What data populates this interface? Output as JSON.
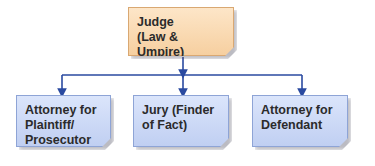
{
  "diagram": {
    "type": "hierarchy",
    "root": {
      "label_line1": "Judge",
      "label_line2": "(Law & Umpire)"
    },
    "children": [
      {
        "line1": "Attorney for",
        "line2": "Plaintiff/",
        "line3": "Prosecutor"
      },
      {
        "line1": "Jury (Finder",
        "line2": "of Fact)",
        "line3": ""
      },
      {
        "line1": "Attorney for",
        "line2": "Defendant",
        "line3": ""
      }
    ],
    "colors": {
      "root_fill": "#f8d8b0",
      "child_fill": "#cad8f6",
      "connector": "#2a4aa0"
    }
  }
}
